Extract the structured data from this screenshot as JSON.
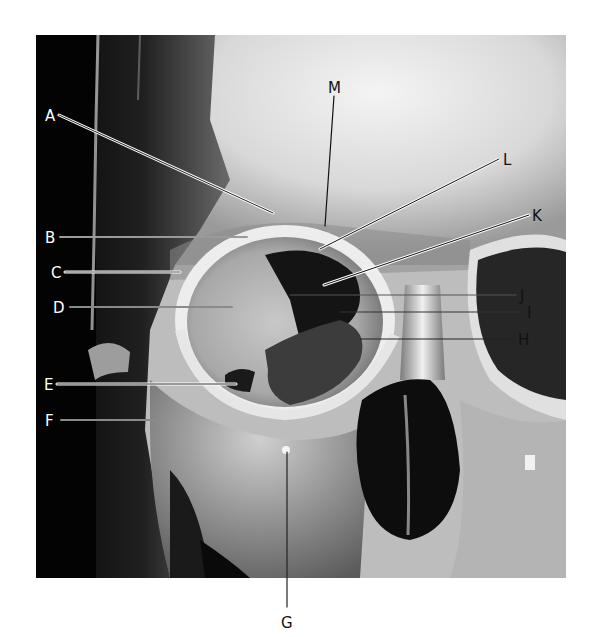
{
  "figure": {
    "colors": {
      "background": "#ffffff",
      "image_dark": "#050505",
      "bone_light": "#e6e6e6",
      "label_on_dark": "#ffffff",
      "label_on_light": "#111111"
    },
    "labels": [
      {
        "id": "A",
        "text": "A"
      },
      {
        "id": "B",
        "text": "B"
      },
      {
        "id": "C",
        "text": "C"
      },
      {
        "id": "D",
        "text": "D"
      },
      {
        "id": "E",
        "text": "E"
      },
      {
        "id": "F",
        "text": "F"
      },
      {
        "id": "G",
        "text": "G"
      },
      {
        "id": "H",
        "text": "H"
      },
      {
        "id": "I",
        "text": "I"
      },
      {
        "id": "J",
        "text": "J"
      },
      {
        "id": "K",
        "text": "K"
      },
      {
        "id": "L",
        "text": "L"
      },
      {
        "id": "M",
        "text": "M"
      }
    ]
  }
}
